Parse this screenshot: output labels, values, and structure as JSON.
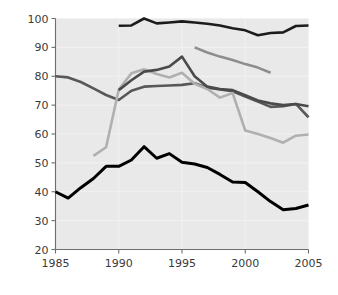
{
  "chart_data": {
    "type": "line",
    "title": "",
    "xlabel": "Year",
    "ylabel": "Percent container redemption rate",
    "xlim": [
      1985,
      2005
    ],
    "ylim": [
      20,
      100
    ],
    "xticks": [
      "1985",
      "1990",
      "1995",
      "2000",
      "2005"
    ],
    "yticks": [
      "20",
      "30",
      "40",
      "50",
      "60",
      "70",
      "80",
      "90",
      "100"
    ],
    "grid": true,
    "legend_position": "inside-lower-left",
    "plot_background": "#e9e9e9",
    "series": [
      {
        "name": "Michigan",
        "color": "#1c1c1c",
        "width": 2.6,
        "x": [
          1990,
          1991,
          1992,
          1993,
          1994,
          1995,
          1996,
          1997,
          1998,
          1999,
          2000,
          2001,
          2002,
          2003,
          2004,
          2005
        ],
        "values": [
          97.5,
          97.6,
          100.0,
          98.3,
          98.6,
          99.0,
          98.6,
          98.2,
          97.6,
          96.6,
          95.9,
          94.2,
          95.0,
          95.2,
          97.4,
          97.6
        ]
      },
      {
        "name": "Oregon",
        "color": "#585858",
        "width": 2.6,
        "x": [
          1985,
          1986,
          1987,
          1988,
          1989,
          1990,
          1991,
          1992,
          1993,
          1994,
          1995,
          1996,
          1997,
          1998,
          1999,
          2000,
          2001,
          2002,
          2003,
          2004,
          2005
        ],
        "values": [
          80.0,
          79.6,
          78.0,
          75.8,
          73.5,
          71.8,
          75.0,
          76.4,
          76.6,
          76.8,
          77.0,
          77.6,
          76.0,
          75.4,
          74.8,
          73.0,
          71.2,
          69.4,
          69.6,
          70.4,
          65.8
        ]
      },
      {
        "name": "Massachusetts",
        "color": "#8d8d8d",
        "width": 2.6,
        "x": [
          1996,
          1997,
          1998,
          1999,
          2000,
          2001,
          2002
        ],
        "values": [
          90.0,
          88.2,
          86.8,
          85.6,
          84.2,
          83.0,
          81.2
        ]
      },
      {
        "name": "California",
        "color": "#b0b0b0",
        "width": 2.6,
        "x": [
          1988,
          1989,
          1990,
          1991,
          1992,
          1993,
          1994,
          1995,
          1996,
          1997,
          1998,
          1999,
          2000,
          2001,
          2002,
          2003,
          2004,
          2005
        ],
        "values": [
          52.4,
          55.4,
          75.4,
          81.0,
          82.4,
          80.8,
          79.6,
          81.2,
          77.4,
          75.6,
          72.6,
          74.2,
          61.2,
          60.0,
          58.6,
          57.0,
          59.4,
          59.8
        ]
      },
      {
        "name": "New York",
        "color": "#4a4a4a",
        "width": 2.6,
        "x": [
          1990,
          1991,
          1992,
          1993,
          1994,
          1995,
          1996,
          1997,
          1998,
          1999,
          2000,
          2001,
          2002,
          2003,
          2004,
          2005
        ],
        "values": [
          75.2,
          78.6,
          81.6,
          82.2,
          83.4,
          86.8,
          80.0,
          76.4,
          75.6,
          75.2,
          73.4,
          71.6,
          70.6,
          70.0,
          70.4,
          69.6
        ]
      },
      {
        "name": "United States",
        "color": "#000000",
        "width": 3.0,
        "x": [
          1985,
          1986,
          1987,
          1988,
          1989,
          1990,
          1991,
          1992,
          1993,
          1994,
          1995,
          1996,
          1997,
          1998,
          1999,
          2000,
          2001,
          2002,
          2003,
          2004,
          2005
        ],
        "values": [
          40.0,
          37.8,
          41.4,
          44.6,
          48.8,
          48.8,
          51.0,
          55.6,
          51.6,
          53.2,
          50.2,
          49.6,
          48.4,
          46.0,
          43.4,
          43.2,
          40.0,
          36.6,
          33.8,
          34.2,
          35.4
        ]
      }
    ]
  },
  "legend": {
    "columns": [
      {
        "items": [
          {
            "label": "Michigan",
            "color": "#1c1c1c"
          },
          {
            "label": "Oregon",
            "color": "#585858"
          },
          {
            "label": "Massachusetts",
            "color": "#8d8d8d"
          }
        ]
      },
      {
        "items": [
          {
            "label": "California",
            "color": "#b0b0b0"
          },
          {
            "label": "New York",
            "color": "#4a4a4a"
          },
          {
            "label": "United States",
            "color": "#000000"
          }
        ]
      }
    ]
  }
}
